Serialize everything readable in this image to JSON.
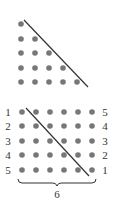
{
  "colors": {
    "dot": "#777777",
    "line": "#333333",
    "text": "#333333",
    "background": "#ffffff"
  },
  "top_triangle": {
    "dot_cols_x": [
      21,
      35,
      49,
      63,
      77
    ],
    "rows_y": [
      24,
      39,
      53,
      68,
      82
    ],
    "row_counts": [
      1,
      2,
      3,
      4,
      5
    ],
    "diagonal": {
      "x1": 24,
      "y1": 20,
      "x2": 88,
      "y2": 87
    }
  },
  "bottom_grid": {
    "cols_x": [
      22,
      36,
      50,
      64,
      78,
      92
    ],
    "rows_y": [
      112,
      126,
      141,
      155,
      170
    ],
    "left_labels": [
      "1",
      "2",
      "3",
      "4",
      "5"
    ],
    "right_labels": [
      "5",
      "4",
      "3",
      "2",
      "1"
    ],
    "diagonal": {
      "x1": 26,
      "y1": 108,
      "x2": 89,
      "y2": 176
    },
    "brace_label": "6"
  }
}
